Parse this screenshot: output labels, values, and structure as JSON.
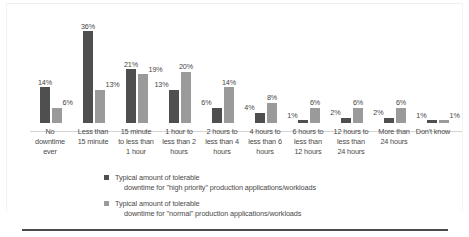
{
  "chart_data": {
    "type": "bar",
    "title": "",
    "subtitle": "",
    "xlabel": "",
    "ylabel": "",
    "ylim": [
      0,
      36
    ],
    "grid": false,
    "legend_position": "bottom",
    "categories": [
      "No downtime ever",
      "Less than 15 minute",
      "15 minute to less than 1 hour",
      "1 hour to less than 2 hours",
      "2 hours to less than 4 hours",
      "4 hours to less than 6 hours",
      "6 hours to less than 12 hours",
      "12 hours to less than 24 hours",
      "More than 24 hours",
      "Don't know"
    ],
    "category_lines": [
      [
        "No",
        "downtime",
        "ever"
      ],
      [
        "Less than",
        "15 minute",
        ""
      ],
      [
        "15 minute",
        "to less than",
        "1 hour"
      ],
      [
        "1 hour to",
        "less than 2",
        "hours"
      ],
      [
        "2 hours to",
        "less than 4",
        "hours"
      ],
      [
        "4 hours to",
        "less than 6",
        "hours"
      ],
      [
        "6 hours to",
        "less than",
        "12 hours"
      ],
      [
        "12 hours to",
        "less than",
        "24 hours"
      ],
      [
        "More than",
        "24 hours",
        ""
      ],
      [
        "Don't know",
        "",
        ""
      ]
    ],
    "series": [
      {
        "name": "Typical amount of tolerable downtime for \"high priority\" production applications/workloads",
        "color": "#4f4f4f",
        "values": [
          14,
          36,
          21,
          13,
          6,
          4,
          1,
          2,
          2,
          1
        ],
        "labels": [
          "14%",
          "36%",
          "21%",
          "13%",
          "6%",
          "4%",
          "1%",
          "2%",
          "2%",
          "1%"
        ]
      },
      {
        "name": "Typical amount of tolerable downtime for \"normal\" production applications/workloads",
        "color": "#9a9a9a",
        "values": [
          6,
          13,
          19,
          20,
          14,
          8,
          6,
          6,
          6,
          1
        ],
        "labels": [
          "6%",
          "13%",
          "19%",
          "20%",
          "14%",
          "8%",
          "6%",
          "6%",
          "6%",
          "1%"
        ]
      }
    ]
  },
  "legend": {
    "items": [
      {
        "line1": "Typical amount of tolerable",
        "line2": "downtime for \"high priority\" production applications/workloads",
        "swatch": "dark-gray-swatch"
      },
      {
        "line1": "Typical amount of tolerable",
        "line2": "downtime for \"normal\" production applications/workloads",
        "swatch": "medium-gray-swatch"
      }
    ]
  }
}
